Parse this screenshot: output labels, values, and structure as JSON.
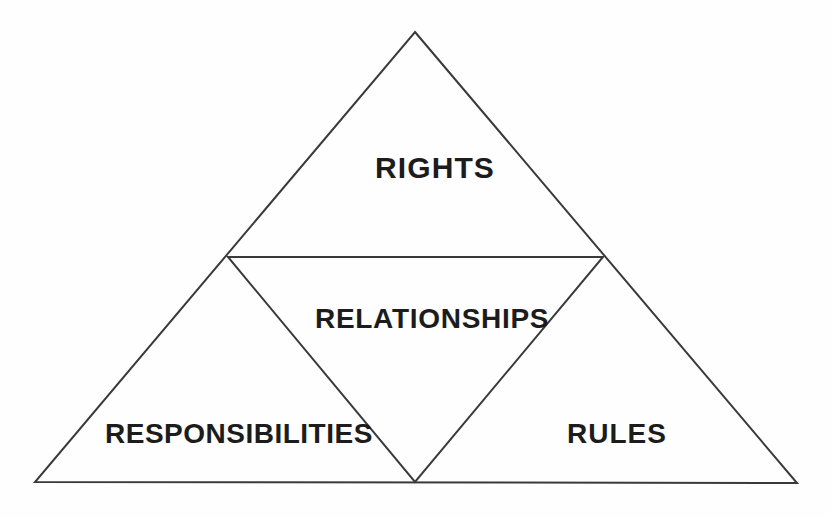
{
  "diagram": {
    "type": "triangle-framework",
    "title": "",
    "background_color": "#fefefe",
    "line_color": "#3a3a3a",
    "text_color": "#1c1c1c",
    "outer_triangle": {
      "apex": [
        415,
        32
      ],
      "bottom_left": [
        35,
        482
      ],
      "bottom_right": [
        797,
        483
      ],
      "stroke_width": 2
    },
    "inner_inverted_triangle": {
      "left": [
        228,
        257
      ],
      "right": [
        603,
        257
      ],
      "bottom": [
        415,
        482
      ],
      "stroke_width": 2
    },
    "zones": [
      {
        "id": "rights",
        "label": "RIGHTS",
        "position": "top",
        "center": [
          420,
          168
        ]
      },
      {
        "id": "relationships",
        "label": "RELATIONSHIPS",
        "position": "center-inverted",
        "center": [
          418,
          320
        ]
      },
      {
        "id": "responsibilities",
        "label": "RESPONSIBILITIES",
        "position": "bottom-left",
        "center": [
          222,
          435
        ]
      },
      {
        "id": "rules",
        "label": "RULES",
        "position": "bottom-right",
        "center": [
          611,
          435
        ]
      }
    ]
  }
}
